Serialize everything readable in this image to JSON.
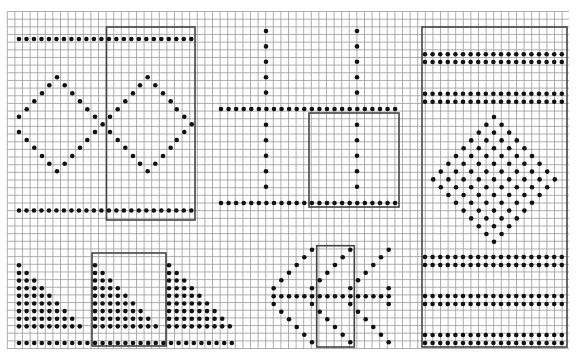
{
  "colors": {
    "background": "#ffffff",
    "grid_line": "#9a9a9a",
    "box_line": "#444444",
    "dot": "#111111"
  },
  "grid": {
    "x0": 7.3,
    "y0": 11.5,
    "x1": 569,
    "y1": 349,
    "cell_w": 7.6,
    "cell_h": 7.66
  },
  "dot_radius": 2.3,
  "boxes": [
    {
      "name": "box-top-left",
      "x": 106.5,
      "y": 27,
      "w": 88.5,
      "h": 193
    },
    {
      "name": "box-middle",
      "x": 309,
      "y": 113,
      "w": 90,
      "h": 94
    },
    {
      "name": "box-right-panel",
      "x": 422,
      "y": 27,
      "w": 145,
      "h": 320
    },
    {
      "name": "box-bottom-left",
      "x": 92,
      "y": 253,
      "w": 74,
      "h": 93
    },
    {
      "name": "box-bottom-middle",
      "x": 316.7,
      "y": 245.7,
      "w": 37.6,
      "h": 101.3
    }
  ],
  "dot_rows": [
    {
      "name": "top-left-top-row",
      "x": 19,
      "y": 39,
      "count": 24,
      "dx": 7.49
    },
    {
      "name": "top-left-bottom-row",
      "x": 19,
      "y": 210.5,
      "count": 24,
      "dx": 7.49
    },
    {
      "name": "middle-cross-row-1",
      "x": 221,
      "y": 109,
      "count": 24,
      "dx": 7.57
    },
    {
      "name": "middle-cross-row-2",
      "x": 221,
      "y": 203,
      "count": 24,
      "dx": 7.57
    },
    {
      "name": "right-row-1a",
      "x": 425,
      "y": 54.3,
      "count": 19,
      "dx": 7.6
    },
    {
      "name": "right-row-1b",
      "x": 425,
      "y": 62,
      "count": 19,
      "dx": 7.6
    },
    {
      "name": "right-row-2a",
      "x": 425,
      "y": 93.7,
      "count": 19,
      "dx": 7.6
    },
    {
      "name": "right-row-2b",
      "x": 425,
      "y": 101.7,
      "count": 19,
      "dx": 7.6
    },
    {
      "name": "right-row-3a",
      "x": 425,
      "y": 257,
      "count": 19,
      "dx": 7.6
    },
    {
      "name": "right-row-3b",
      "x": 425,
      "y": 265,
      "count": 19,
      "dx": 7.6
    },
    {
      "name": "right-row-4a",
      "x": 425,
      "y": 296,
      "count": 19,
      "dx": 7.6
    },
    {
      "name": "right-row-4b",
      "x": 425,
      "y": 304,
      "count": 19,
      "dx": 7.6
    },
    {
      "name": "right-row-5a",
      "x": 425,
      "y": 335,
      "count": 19,
      "dx": 7.6
    },
    {
      "name": "right-row-5b",
      "x": 425,
      "y": 343,
      "count": 19,
      "dx": 7.6
    },
    {
      "name": "bottom-left-base-row",
      "x": 19,
      "y": 343,
      "count": 29,
      "dx": 7.6
    },
    {
      "name": "bottom-middle-center-row",
      "x": 273.7,
      "y": 296.3,
      "count": 16,
      "dx": 7.67
    }
  ],
  "dot_columns": [
    {
      "name": "cross-col-left-upper",
      "x": 266,
      "y": 31,
      "count": 5,
      "dy": 15.4
    },
    {
      "name": "cross-col-right-upper",
      "x": 357,
      "y": 31,
      "count": 5,
      "dy": 15.4
    },
    {
      "name": "cross-col-left-lower",
      "x": 266,
      "y": 124.7,
      "count": 5,
      "dy": 15.5
    },
    {
      "name": "cross-col-right-lower",
      "x": 357,
      "y": 124.7,
      "count": 5,
      "dy": 15.5
    }
  ],
  "triangles": [
    {
      "name": "triangle-1",
      "x": 19,
      "y": 265.3,
      "rows": 9,
      "dx": 7.6,
      "dy": 7.63
    },
    {
      "name": "triangle-2",
      "x": 95,
      "y": 265.3,
      "rows": 9,
      "dx": 7.6,
      "dy": 7.63
    },
    {
      "name": "triangle-3",
      "x": 169,
      "y": 265.3,
      "rows": 9,
      "dx": 7.6,
      "dy": 7.63
    }
  ],
  "checker_diamonds": [
    {
      "name": "right-filled-diamond",
      "cx": 494,
      "top": 117,
      "half_rows": 8,
      "dx": 7.6,
      "dy": 7.8
    }
  ],
  "points": [
    {
      "name": "left-diamond-1",
      "pts": [
        [
          19,
          116.7
        ],
        [
          26.7,
          109.3
        ],
        [
          34.3,
          101.3
        ],
        [
          42,
          93.3
        ],
        [
          49.3,
          85.3
        ],
        [
          57,
          77.3
        ],
        [
          64.7,
          85.3
        ],
        [
          72.3,
          93.3
        ],
        [
          80,
          101.3
        ],
        [
          87.3,
          109.3
        ],
        [
          95,
          116.7
        ],
        [
          102.7,
          124.3
        ],
        [
          19,
          132
        ],
        [
          26.7,
          140
        ],
        [
          34.3,
          147.7
        ],
        [
          42,
          156
        ],
        [
          49.3,
          163.7
        ],
        [
          57,
          171.3
        ],
        [
          64.7,
          163.7
        ],
        [
          72.3,
          156
        ],
        [
          80,
          147.7
        ],
        [
          87.3,
          140
        ],
        [
          95,
          132
        ]
      ]
    },
    {
      "name": "left-diamond-2",
      "pts": [
        [
          110,
          116.7
        ],
        [
          117.7,
          109.3
        ],
        [
          125.3,
          101.3
        ],
        [
          133,
          93.3
        ],
        [
          140,
          85.3
        ],
        [
          147.7,
          77.3
        ],
        [
          155.3,
          85.3
        ],
        [
          163,
          93.3
        ],
        [
          170.7,
          101.3
        ],
        [
          176.7,
          109.3
        ],
        [
          184.3,
          116.7
        ],
        [
          191.7,
          124.3
        ],
        [
          110,
          132
        ],
        [
          117.7,
          140
        ],
        [
          125.3,
          147.7
        ],
        [
          133,
          156
        ],
        [
          140,
          163.7
        ],
        [
          147.7,
          171.3
        ],
        [
          155.3,
          163.7
        ],
        [
          163,
          156
        ],
        [
          170.7,
          147.7
        ],
        [
          176.7,
          140
        ],
        [
          184.3,
          132
        ]
      ]
    },
    {
      "name": "bottom-middle-chevrons",
      "pts": [
        [
          312,
          249.7
        ],
        [
          350.3,
          249.7
        ],
        [
          388.7,
          249.7
        ],
        [
          304.3,
          257.3
        ],
        [
          342.7,
          257.3
        ],
        [
          381,
          257.3
        ],
        [
          296.7,
          265
        ],
        [
          335,
          265
        ],
        [
          373.3,
          265
        ],
        [
          289,
          272.7
        ],
        [
          327.3,
          272.7
        ],
        [
          365.7,
          272.7
        ],
        [
          281.3,
          280.3
        ],
        [
          319.7,
          280.3
        ],
        [
          358,
          280.3
        ],
        [
          273.7,
          288.3
        ],
        [
          312,
          288.3
        ],
        [
          350.3,
          288.3
        ],
        [
          388.7,
          288.3
        ],
        [
          273.7,
          304
        ],
        [
          312,
          304
        ],
        [
          350.3,
          304
        ],
        [
          388.7,
          304
        ],
        [
          281.3,
          311.7
        ],
        [
          319.7,
          311.7
        ],
        [
          358,
          311.7
        ],
        [
          289,
          319.3
        ],
        [
          327.3,
          319.3
        ],
        [
          365.7,
          319.3
        ],
        [
          296.7,
          327
        ],
        [
          335,
          327
        ],
        [
          373.3,
          327
        ],
        [
          304.3,
          334.7
        ],
        [
          342.7,
          334.7
        ],
        [
          381,
          334.7
        ],
        [
          312,
          342.3
        ],
        [
          350.3,
          342.3
        ],
        [
          388.7,
          342.3
        ]
      ]
    }
  ]
}
